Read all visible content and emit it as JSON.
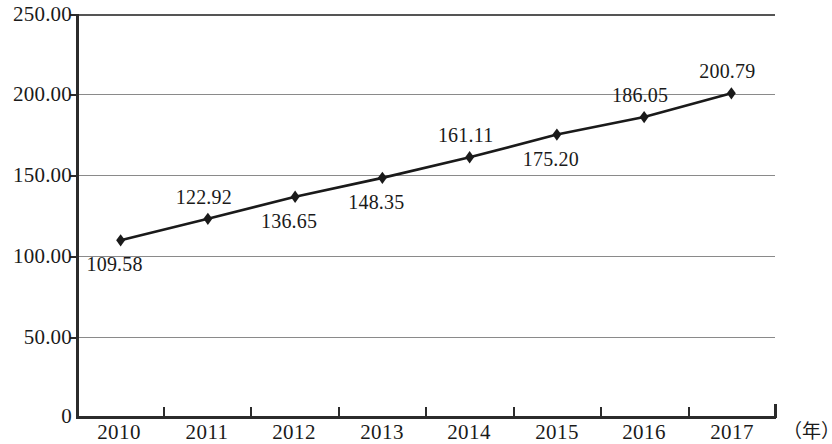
{
  "chart_data": {
    "type": "line",
    "title": "",
    "xlabel": "（年）",
    "ylabel": "",
    "categories": [
      "2010",
      "2011",
      "2012",
      "2013",
      "2014",
      "2015",
      "2016",
      "2017"
    ],
    "values": [
      109.58,
      122.92,
      136.65,
      148.35,
      161.11,
      175.2,
      186.05,
      200.79
    ],
    "value_labels": [
      "109.58",
      "122.92",
      "136.65",
      "148.35",
      "161.11",
      "175.20",
      "186.05",
      "200.79"
    ],
    "series": [
      {
        "name": "",
        "values": [
          109.58,
          122.92,
          136.65,
          148.35,
          161.11,
          175.2,
          186.05,
          200.79
        ]
      }
    ],
    "ylim": [
      0,
      250
    ],
    "ytick_values": [
      250,
      200,
      150,
      100,
      50,
      0
    ],
    "ytick_labels": [
      "250.00",
      "200.00",
      "150.00",
      "100.00",
      "50.00",
      "0"
    ],
    "grid": true,
    "legend": false,
    "marker": "diamond",
    "line_color": "#1a1a1a",
    "grid_color": "#8a8a8a",
    "axis_color": "#2b2b2b",
    "label_position": [
      "below",
      "above",
      "below",
      "below",
      "above",
      "below",
      "above",
      "above"
    ]
  }
}
